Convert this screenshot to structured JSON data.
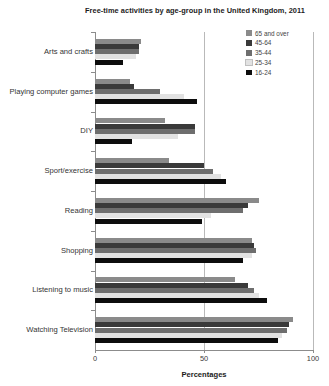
{
  "chart_data": {
    "type": "bar",
    "orientation": "horizontal",
    "title": "Free-time activities by age-group in the United Kingdom, 2011",
    "xlabel": "Percentages",
    "ylabel": "",
    "xlim": [
      0,
      100
    ],
    "xticks": [
      0,
      50,
      100
    ],
    "xticklabels": [
      "0",
      "50",
      "100"
    ],
    "grid": true,
    "grid_axis": "x",
    "legend_position": "top-right",
    "categories": [
      "Arts and crafts",
      "Playing computer games",
      "DIY",
      "Sport/exercise",
      "Reading",
      "Shopping",
      "Listening to music",
      "Watching Television"
    ],
    "series": [
      {
        "name": "65 and over",
        "color": "#8a8a8a",
        "values": [
          21,
          16,
          32,
          34,
          75,
          72,
          64,
          91
        ]
      },
      {
        "name": "45-64",
        "color": "#3a3a3a",
        "values": [
          20,
          18,
          46,
          50,
          70,
          73,
          70,
          89
        ]
      },
      {
        "name": "35-44",
        "color": "#6e6e6e",
        "values": [
          20,
          30,
          46,
          54,
          68,
          74,
          73,
          88
        ]
      },
      {
        "name": "25-34",
        "color": "#e2e2e2",
        "values": [
          19,
          41,
          38,
          58,
          53,
          72,
          75,
          86
        ]
      },
      {
        "name": "16-24",
        "color": "#0d0d0d",
        "values": [
          13,
          47,
          17,
          60,
          49,
          68,
          79,
          84
        ]
      }
    ]
  },
  "legend": {
    "items": [
      {
        "label": "65 and over",
        "color": "#8a8a8a"
      },
      {
        "label": "45-64",
        "color": "#3a3a3a"
      },
      {
        "label": "35-44",
        "color": "#6e6e6e"
      },
      {
        "label": "25-34",
        "color": "#e2e2e2"
      },
      {
        "label": "16-24",
        "color": "#0d0d0d"
      }
    ]
  }
}
